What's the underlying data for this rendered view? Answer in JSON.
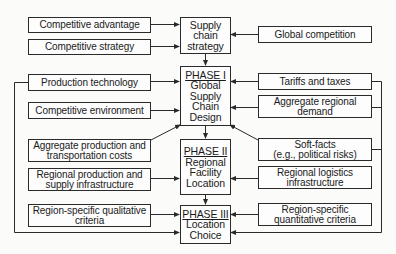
{
  "diagram": {
    "center": {
      "strategy": {
        "lines": [
          "Supply",
          "chain",
          "strategy"
        ]
      },
      "phase1": {
        "header": "PHASE I",
        "lines": [
          "Global",
          "Supply",
          "Chain",
          "Design"
        ]
      },
      "phase2": {
        "header": "PHASE II",
        "lines": [
          "Regional",
          "Facility",
          "Location"
        ]
      },
      "phase3": {
        "header": "PHASE III",
        "lines": [
          "Location",
          "Choice"
        ]
      }
    },
    "left": [
      {
        "lines": [
          "Competitive advantage"
        ]
      },
      {
        "lines": [
          "Competitive strategy"
        ]
      },
      {
        "lines": [
          "Production technology"
        ]
      },
      {
        "lines": [
          "Competitive environment"
        ]
      },
      {
        "lines": [
          "Aggregate production and",
          "transportation costs"
        ]
      },
      {
        "lines": [
          "Regional production and",
          "supply infrastructure"
        ]
      },
      {
        "lines": [
          "Region-specific qualitative",
          "criteria"
        ]
      }
    ],
    "right": [
      {
        "lines": [
          "Global competition"
        ]
      },
      {
        "lines": [
          "Tariffs and taxes"
        ]
      },
      {
        "lines": [
          "Aggregate regional",
          "demand"
        ]
      },
      {
        "lines": [
          "Soft-facts",
          "(e.g., political risks)"
        ]
      },
      {
        "lines": [
          "Regional logistics",
          "infrastructure"
        ]
      },
      {
        "lines": [
          "Region-specific",
          "quantitative criteria"
        ]
      }
    ],
    "colors": {
      "line": "#2a2a2a",
      "box_border": "#2a2a2a",
      "background": "#fbfbfa"
    }
  }
}
